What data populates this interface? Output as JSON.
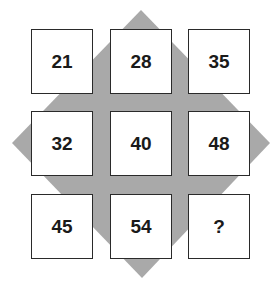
{
  "puzzle": {
    "background_shape": "diamond",
    "diamond_color": "#a9a9a9",
    "grid": [
      [
        "21",
        "28",
        "35"
      ],
      [
        "32",
        "40",
        "48"
      ],
      [
        "45",
        "54",
        "?"
      ]
    ]
  }
}
